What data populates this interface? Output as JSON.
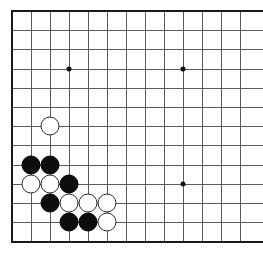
{
  "app": {
    "title": "Go Board Diagram",
    "description": "Go board corner position"
  },
  "board": {
    "visible_columns": 13,
    "visible_rows": 13,
    "origin_x": 12,
    "origin_y": 11,
    "spacing_x": 19.0,
    "spacing_y": 19.2,
    "line_color": "#5a5a5a",
    "edge_color": "#1a1a1a",
    "background_color": "#ffffff",
    "black_color": "#0d0d0d",
    "white_color": "#ffffff",
    "white_outline_color": "#2b2b2b",
    "edges": {
      "left": true,
      "top": true,
      "bottom": true,
      "right": false
    },
    "star_points": [
      {
        "col": 4,
        "row": 4
      },
      {
        "col": 10,
        "row": 4
      },
      {
        "col": 10,
        "row": 10
      }
    ],
    "stones": [
      {
        "color": "white",
        "col": 3,
        "row": 7,
        "label": "white-stone-c3-r7"
      },
      {
        "color": "black",
        "col": 2,
        "row": 9,
        "label": "black-stone-c2-r9"
      },
      {
        "color": "black",
        "col": 3,
        "row": 9,
        "label": "black-stone-c3-r9"
      },
      {
        "color": "white",
        "col": 2,
        "row": 10,
        "label": "white-stone-c2-r10"
      },
      {
        "color": "white",
        "col": 3,
        "row": 10,
        "label": "white-stone-c3-r10"
      },
      {
        "color": "black",
        "col": 4,
        "row": 10,
        "label": "black-stone-c4-r10"
      },
      {
        "color": "black",
        "col": 3,
        "row": 11,
        "label": "black-stone-c3-r11"
      },
      {
        "color": "white",
        "col": 4,
        "row": 11,
        "label": "white-stone-c4-r11"
      },
      {
        "color": "white",
        "col": 5,
        "row": 11,
        "label": "white-stone-c5-r11"
      },
      {
        "color": "white",
        "col": 6,
        "row": 11,
        "label": "white-stone-c6-r11"
      },
      {
        "color": "black",
        "col": 4,
        "row": 12,
        "label": "black-stone-c4-r12"
      },
      {
        "color": "black",
        "col": 5,
        "row": 12,
        "label": "black-stone-c5-r12"
      },
      {
        "color": "white",
        "col": 6,
        "row": 12,
        "label": "white-stone-c6-r12"
      }
    ],
    "counts": {
      "black_stones": 6,
      "white_stones": 7,
      "total_stones": 13
    }
  }
}
